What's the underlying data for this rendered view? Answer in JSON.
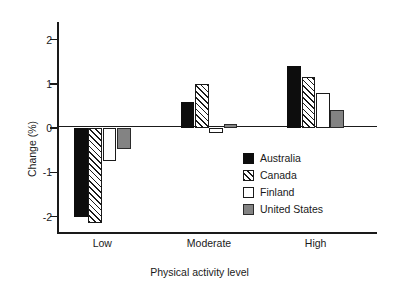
{
  "chart_data": {
    "type": "bar",
    "title": "",
    "xlabel": "Physical activity level",
    "ylabel": "Change (%)",
    "categories": [
      "Low",
      "Moderate",
      "High"
    ],
    "series": [
      {
        "name": "Australia",
        "values": [
          -2.0,
          0.6,
          1.4
        ],
        "fill": "solid",
        "color": "#0d0d0d"
      },
      {
        "name": "Canada",
        "values": [
          -2.15,
          1.0,
          1.15
        ],
        "fill": "hatch",
        "color": "#1a1a1a"
      },
      {
        "name": "Finland",
        "values": [
          -0.75,
          -0.1,
          0.8
        ],
        "fill": "open",
        "color": "#ffffff"
      },
      {
        "name": "United States",
        "values": [
          -0.47,
          0.1,
          0.4
        ],
        "fill": "gray",
        "color": "#838383"
      }
    ],
    "ylim": [
      -2.35,
      2.4
    ],
    "yticks": [
      2,
      1,
      0,
      -1,
      -2
    ],
    "ytick_labels": [
      "2",
      "1",
      "0",
      "-1",
      "-2"
    ],
    "grid": false,
    "legend_position": "bottom-right-inside",
    "zero_line": true
  }
}
